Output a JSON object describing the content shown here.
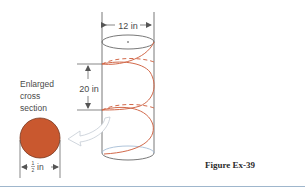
{
  "figure": {
    "caption": "Figure Ex-39",
    "labels": {
      "diameter": "12 in",
      "pitch": "20 in",
      "enlarged_line1": "Enlarged",
      "enlarged_line2": "cross",
      "enlarged_line3": "section",
      "wire_width_unit": "in",
      "wire_width_num": "1",
      "wire_width_den": "2"
    },
    "colors": {
      "helix": "#d2694a",
      "cross_section_fill": "#c9582f",
      "cross_section_stroke": "#7a3a22",
      "outline": "#555555",
      "rule": "#9fb6cc"
    }
  }
}
